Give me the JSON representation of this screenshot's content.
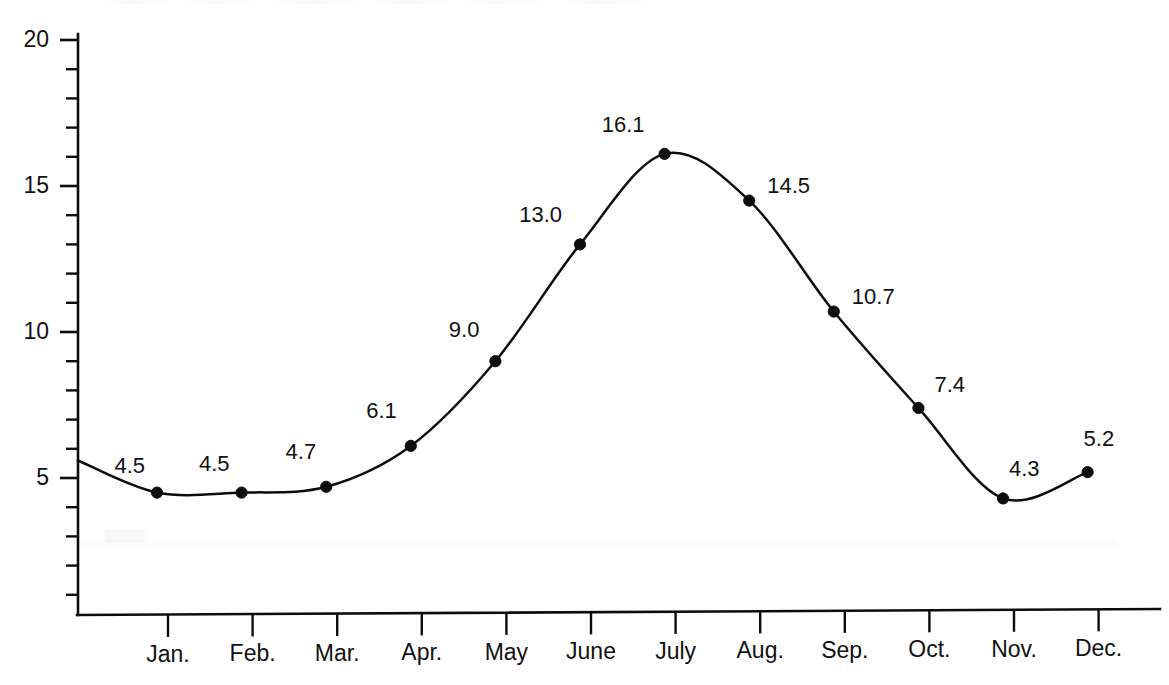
{
  "chart_data": {
    "type": "line",
    "title": "",
    "subtitle": "",
    "xlabel": "",
    "ylabel": "",
    "categories": [
      "Jan.",
      "Feb.",
      "Mar.",
      "Apr.",
      "May",
      "June",
      "July",
      "Aug.",
      "Sep.",
      "Oct.",
      "Nov.",
      "Dec."
    ],
    "values": [
      4.5,
      4.5,
      4.7,
      6.1,
      9.0,
      13.0,
      16.1,
      14.5,
      10.7,
      7.4,
      4.3,
      5.2
    ],
    "point_labels": [
      "4.5",
      "4.5",
      "4.7",
      "6.1",
      "9.0",
      "13.0",
      "16.1",
      "14.5",
      "10.7",
      "7.4",
      "4.3",
      "5.2"
    ],
    "ylim": [
      0,
      20
    ],
    "y_major_ticks": [
      5,
      10,
      15,
      20
    ],
    "y_major_tick_labels": [
      "5",
      "10",
      "15",
      "20"
    ],
    "y_minor_ticks": [
      1,
      2,
      3,
      4,
      6,
      7,
      8,
      9,
      11,
      12,
      13,
      14,
      16,
      17,
      18,
      19
    ],
    "grid": false,
    "legend": false,
    "legend_position": "none",
    "line_color": "#0d0d0d",
    "marker_color": "#0d0d0d",
    "marker_shape": "circle",
    "background_color": "#ffffff",
    "curve_smoothing": "spline"
  },
  "axes": {
    "y_axis_label_text": "",
    "x_axis_label_text": ""
  }
}
